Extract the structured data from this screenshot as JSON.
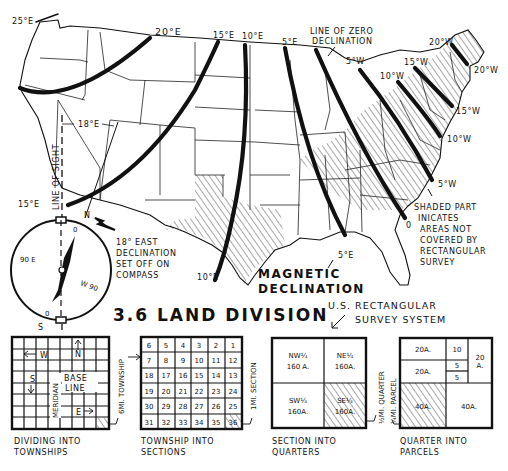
{
  "figure": {
    "title": "3.6 LAND DIVISION",
    "subtitle_lines": [
      "U.S. RECTANGULAR",
      "SURVEY SYSTEM"
    ],
    "map_title_lines": [
      "MAGNETIC",
      "DECLINATION"
    ]
  },
  "map": {
    "isogonic_labels": {
      "e25": "25°E",
      "e20": "20°E",
      "e15_top": "15°E",
      "e10_top": "10°E",
      "e5_top": "5°E",
      "e15_left": "15°E",
      "e10_bottom": "10°E",
      "e5_bottom": "5°E",
      "zero_bottom": "0",
      "w5_top": "5°W",
      "w10_top": "10°W",
      "w15_top": "15°W",
      "w20_top": "20°W",
      "w20_right": "20°W",
      "w15_right": "15°W",
      "w10_right": "10°W",
      "w5_right": "5°W"
    },
    "zero_line_label": [
      "LINE OF ZERO",
      "DECLINATION"
    ],
    "line_of_sight_label": "LINE OF SIGHT",
    "declination_angle_label": "18°E",
    "shaded_note": [
      "SHADED PART",
      "INICATES",
      "AREAS NOT",
      "COVERED BY",
      "RECTANGULAR",
      "SURVEY"
    ]
  },
  "compass": {
    "north": "N",
    "south": "S",
    "east": "90 E",
    "west": "W 90",
    "zero_top": "0",
    "zero_bottom": "0",
    "note": [
      "18° EAST",
      "DECLINATION",
      "SET OFF ON",
      "COMPASS"
    ]
  },
  "panels": [
    {
      "id": "townships",
      "caption": [
        "DIVIDING INTO",
        "TOWNSHIPS"
      ],
      "labels": {
        "w": "W",
        "n": "N",
        "s": "S",
        "e": "E",
        "base": "BASE",
        "line": "LINE",
        "meridian": "MERIDIAN"
      },
      "side_label": "6MI. TOWNSHIP"
    },
    {
      "id": "sections",
      "caption": [
        "TOWNSHIP INTO",
        "SECTIONS"
      ],
      "rows": [
        [
          "6",
          "5",
          "4",
          "3",
          "2",
          "1"
        ],
        [
          "7",
          "8",
          "9",
          "10",
          "11",
          "12"
        ],
        [
          "18",
          "17",
          "16",
          "15",
          "14",
          "13"
        ],
        [
          "19",
          "20",
          "21",
          "22",
          "23",
          "24"
        ],
        [
          "30",
          "29",
          "28",
          "27",
          "26",
          "25"
        ],
        [
          "31",
          "32",
          "33",
          "34",
          "35",
          "36"
        ]
      ],
      "side_label": "1MI. SECTION"
    },
    {
      "id": "quarters",
      "caption": [
        "SECTION INTO",
        "QUARTERS"
      ],
      "cells": [
        {
          "name": "NW¼",
          "area": "160 A."
        },
        {
          "name": "NE¼",
          "area": "160A."
        },
        {
          "name": "SW¼",
          "area": "160A."
        },
        {
          "name": "SE¼",
          "area": "160A."
        }
      ],
      "side_label": "½MI. QUARTER"
    },
    {
      "id": "parcels",
      "caption": [
        "QUARTER INTO",
        "PARCELS"
      ],
      "cells": {
        "a": "20A.",
        "b": "10",
        "c": "20A.",
        "d": "5",
        "e": "5",
        "f_top": "20",
        "f_bot": "A.",
        "g": "40A.",
        "h": "40A."
      },
      "side_label": "¼MI. PARCEL"
    }
  ]
}
